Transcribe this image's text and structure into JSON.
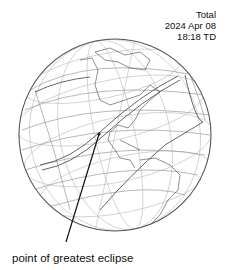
{
  "header": {
    "type": "Total",
    "date": "2024 Apr 08",
    "time": "18:18 TD"
  },
  "annotation": {
    "label": "point of greatest eclipse"
  },
  "map": {
    "projection": "orthographic",
    "region": "North and South America",
    "colors": {
      "outline": "#555555",
      "graticule": "#bbbbbb",
      "coast": "#444444",
      "path": "#666666",
      "pointer": "#111111"
    }
  }
}
